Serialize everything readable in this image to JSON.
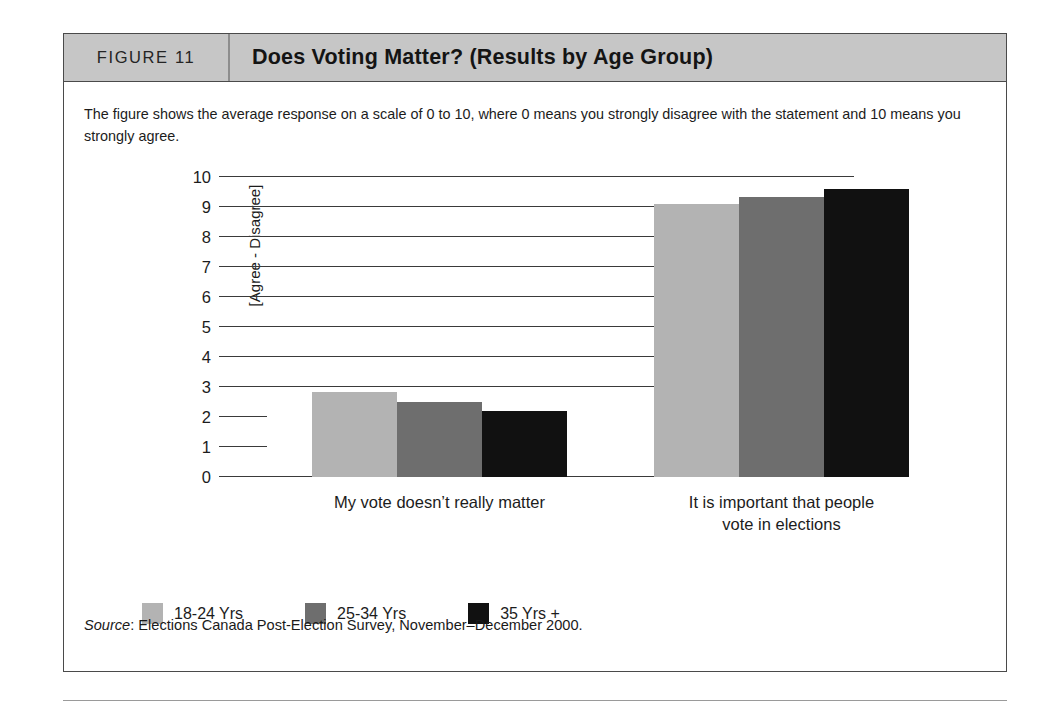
{
  "figure": {
    "number_label": "FIGURE 11",
    "title": "Does Voting Matter? (Results by Age Group)",
    "note": "The figure shows the average response on a scale of 0 to 10, where 0 means you strongly disagree with the statement and 10 means you strongly agree.",
    "source_label": "Source",
    "source_separator": ":",
    "source_text": " Elections Canada Post-Election Survey, November–December 2000."
  },
  "colors": {
    "header_band": "#c6c6c6",
    "frame_border": "#4a4a4a",
    "series_18_24": "#b3b3b3",
    "series_25_34": "#6e6e6e",
    "series_35_plus": "#111111",
    "gridline": "#3a3a3a"
  },
  "chart_data": {
    "type": "bar",
    "title": "Does Voting Matter? (Results by Age Group)",
    "subtitle": "The figure shows the average response on a scale of 0 to 10, where 0 means you strongly disagree with the statement and 10 means you strongly agree.",
    "xlabel": "",
    "ylabel": "[Agree - Disagree]",
    "ylim": [
      0,
      10
    ],
    "yticks": [
      0,
      1,
      2,
      3,
      4,
      5,
      6,
      7,
      8,
      9,
      10
    ],
    "ytick_labels": [
      "0",
      "1",
      "2",
      "3",
      "4",
      "5",
      "6",
      "7",
      "8",
      "9",
      "10"
    ],
    "grid": true,
    "legend_position": "bottom-left",
    "categories": [
      "My vote doesn’t really matter",
      "It is important that people vote in elections"
    ],
    "category_lines": [
      [
        "My vote doesn’t really matter"
      ],
      [
        "It is important that people",
        "vote in elections"
      ]
    ],
    "series": [
      {
        "name": "18-24 Yrs",
        "color": "#b3b3b3",
        "values": [
          2.85,
          9.1
        ]
      },
      {
        "name": "25-34 Yrs",
        "color": "#6e6e6e",
        "values": [
          2.5,
          9.35
        ]
      },
      {
        "name": "35 Yrs +",
        "color": "#111111",
        "values": [
          2.2,
          9.6
        ]
      }
    ]
  },
  "legend": {
    "items": [
      {
        "label": "18-24 Yrs",
        "color": "#b3b3b3"
      },
      {
        "label": "25-34 Yrs",
        "color": "#6e6e6e"
      },
      {
        "label": "35 Yrs +",
        "color": "#111111"
      }
    ]
  }
}
